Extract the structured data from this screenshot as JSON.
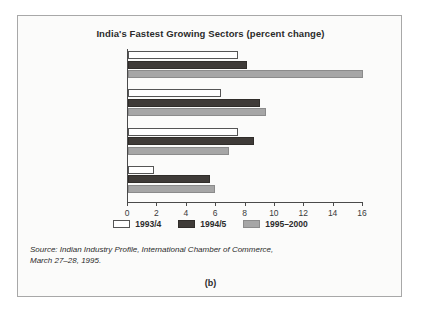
{
  "figure": {
    "title": "India's Fastest Growing Sectors (percent change)",
    "panel_label": "(b)",
    "source_line1": "Source: Indian Industry Profile, International Chamber of Commerce,",
    "source_line2": "March 27–28, 1995."
  },
  "colors": {
    "series_1993_4": "#ffffff",
    "series_1994_5": "#3f3b38",
    "series_1995_2000": "#a6a6a6",
    "axis": "#4a4a4a",
    "frame": "#a8a8a8",
    "background": "#fbfbfa",
    "text": "#2b2b2b"
  },
  "chart_data": {
    "type": "bar",
    "orientation": "horizontal",
    "title": "India's Fastest Growing Sectors (percent change)",
    "xlabel": "",
    "ylabel": "",
    "xlim": [
      0,
      16
    ],
    "xticks": [
      0,
      2,
      4,
      6,
      8,
      10,
      12,
      14,
      16
    ],
    "xtick_labels": [
      "0",
      "2",
      "4",
      "6",
      "8",
      "10",
      "12",
      "14",
      "16"
    ],
    "grid": false,
    "legend_position": "bottom-center",
    "categories": [
      "Electricity Generated",
      "Saleable Steel",
      "Cement",
      "Refined Petroleum"
    ],
    "series": [
      {
        "name": "1993/4",
        "values": [
          7.5,
          6.3,
          7.5,
          1.8
        ]
      },
      {
        "name": "1994/5",
        "values": [
          8.1,
          9.0,
          8.6,
          5.6
        ]
      },
      {
        "name": "1995–2000",
        "values": [
          16.0,
          9.4,
          6.9,
          5.9
        ]
      }
    ]
  }
}
